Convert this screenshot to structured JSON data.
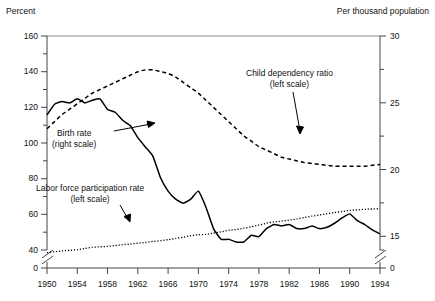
{
  "chart_data": {
    "type": "line",
    "title": "",
    "xlabel": "",
    "ylabel_left": "Percent",
    "ylabel_right": "Per thousand population",
    "grid": false,
    "legend_position": "inline-annotations",
    "x": [
      1950,
      1951,
      1952,
      1953,
      1954,
      1955,
      1956,
      1957,
      1958,
      1959,
      1960,
      1961,
      1962,
      1963,
      1964,
      1965,
      1966,
      1967,
      1968,
      1969,
      1970,
      1971,
      1972,
      1973,
      1974,
      1975,
      1976,
      1977,
      1978,
      1979,
      1980,
      1981,
      1982,
      1983,
      1984,
      1985,
      1986,
      1987,
      1988,
      1989,
      1990,
      1991,
      1992,
      1993,
      1994
    ],
    "xlim": [
      1950,
      1994
    ],
    "xticks": [
      1950,
      1954,
      1958,
      1962,
      1966,
      1970,
      1974,
      1978,
      1982,
      1986,
      1990,
      1994
    ],
    "ylim_left": [
      40,
      160
    ],
    "yticks_left": [
      40,
      60,
      80,
      100,
      120,
      140,
      160
    ],
    "ylim_right": [
      14,
      30
    ],
    "yticks_right": [
      15,
      20,
      25,
      30
    ],
    "axis_break": true,
    "axis_break_zero_label_left": "0",
    "axis_break_zero_label_right": "0",
    "series": [
      {
        "name": "Child dependency ratio",
        "scale": "left",
        "style": "dashed",
        "annotation": "Child dependency ratio\n(left scale)",
        "values": [
          108,
          112,
          116,
          119,
          122,
          125,
          128,
          130,
          132,
          134,
          136,
          138,
          140,
          141,
          141,
          140,
          139,
          137,
          134,
          131,
          128,
          124,
          120,
          116,
          112,
          108,
          104,
          101,
          98,
          96,
          94,
          92,
          91,
          90,
          89,
          88.5,
          88,
          87.5,
          87,
          87,
          87,
          87,
          87,
          87.5,
          88
        ]
      },
      {
        "name": "Labor force participation rate",
        "scale": "left",
        "style": "dotted",
        "annotation": "Labor force participation rate\n(left scale)",
        "values": [
          38.5,
          39,
          39.5,
          39.8,
          40.2,
          40.8,
          41.5,
          41.8,
          42,
          42.5,
          43,
          43.3,
          43.8,
          44.2,
          44.8,
          45.2,
          45.8,
          46.5,
          47.2,
          48,
          48.5,
          48.8,
          49.5,
          50.2,
          51,
          51.5,
          52.2,
          53,
          54,
          55,
          55.8,
          56.2,
          56.8,
          57.4,
          58.2,
          59,
          59.6,
          60.4,
          61,
          61.6,
          62.2,
          62.5,
          62.8,
          63,
          63.2
        ]
      },
      {
        "name": "Birth rate",
        "scale": "right",
        "style": "solid",
        "annotation": "Birth rate\n(right scale)",
        "values": [
          24.1,
          24.9,
          25.1,
          25.0,
          25.3,
          25.0,
          25.2,
          25.3,
          24.5,
          24.3,
          23.7,
          23.3,
          22.4,
          21.7,
          21.0,
          19.4,
          18.4,
          17.8,
          17.5,
          17.8,
          18.4,
          17.2,
          15.6,
          14.8,
          14.8,
          14.6,
          14.6,
          15.1,
          15.0,
          15.6,
          15.9,
          15.8,
          15.9,
          15.6,
          15.6,
          15.8,
          15.6,
          15.7,
          16.0,
          16.4,
          16.7,
          16.2,
          15.9,
          15.5,
          15.2
        ]
      }
    ]
  },
  "axes": {
    "left_title": "Percent",
    "right_title": "Per thousand population",
    "left_ticks": [
      "160",
      "140",
      "120",
      "100",
      "80",
      "60",
      "40"
    ],
    "left_zero": "0",
    "right_ticks": [
      "30",
      "25",
      "20",
      "15"
    ],
    "right_zero": "0",
    "x_ticks": [
      "1950",
      "1954",
      "1958",
      "1962",
      "1966",
      "1970",
      "1974",
      "1978",
      "1982",
      "1986",
      "1990",
      "1994"
    ]
  },
  "annotations": {
    "child_dependency": {
      "line1": "Child dependency ratio",
      "line2": "(left scale)"
    },
    "birth_rate": {
      "line1": "Birth rate",
      "line2": "(right scale)"
    },
    "labor_force": {
      "line1": "Labor force participation rate",
      "line2": "(left scale)"
    }
  }
}
